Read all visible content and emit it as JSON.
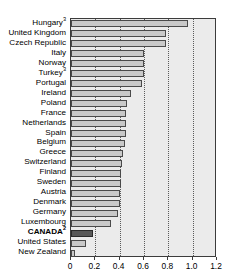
{
  "chart_data": {
    "type": "bar",
    "orientation": "horizontal",
    "title": "",
    "xlabel": "",
    "ylabel": "",
    "xlim": [
      0,
      1.2
    ],
    "xticks": [
      "0",
      "0.2",
      "0.4",
      "0.6",
      "0.8",
      "1.0",
      "1.2"
    ],
    "xtick_values": [
      0,
      0.2,
      0.4,
      0.6,
      0.8,
      1.0,
      1.2
    ],
    "gridlines": [
      0.2,
      0.4,
      0.6,
      0.8,
      1.0
    ],
    "grid": true,
    "legend": null,
    "categories": [
      "Hungary",
      "United Kingdom",
      "Czech Republic",
      "Italy",
      "Norway",
      "Turkey",
      "Portugal",
      "Ireland",
      "Poland",
      "France",
      "Netherlands",
      "Spain",
      "Belgium",
      "Greece",
      "Switzerland",
      "Finland",
      "Sweden",
      "Austria",
      "Denmark",
      "Germany",
      "Luxembourg",
      "CANADA",
      "United States",
      "New Zealand"
    ],
    "values": [
      0.96,
      0.78,
      0.78,
      0.6,
      0.6,
      0.6,
      0.58,
      0.49,
      0.46,
      0.45,
      0.45,
      0.45,
      0.44,
      0.43,
      0.42,
      0.41,
      0.41,
      0.4,
      0.4,
      0.39,
      0.33,
      0.18,
      0.12,
      0.03
    ],
    "footnotes": {
      "Hungary": "3",
      "Turkey": "3",
      "CANADA": "2"
    },
    "highlight_category": "CANADA",
    "colors": {
      "bar_fill": "#c9c9c9",
      "bar_border": "#4a4a4a",
      "highlight_fill": "#585858",
      "highlight_border": "#2a2a2a",
      "plot_background": "#ebebeb",
      "frame": "#3c3c3c",
      "gridline": "#5a5a5a",
      "text": "#000000"
    }
  }
}
